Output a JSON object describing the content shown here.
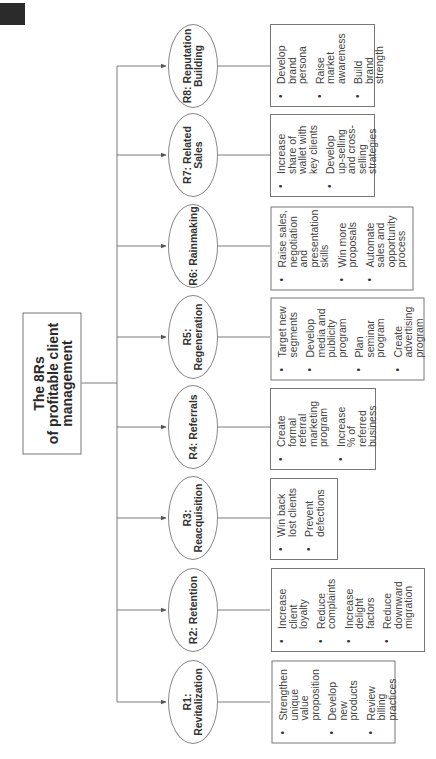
{
  "title": {
    "line1": "The 8Rs",
    "line2": "of profitable client",
    "line3": "management"
  },
  "colors": {
    "line": "#7a7a7a",
    "text": "#2a2a2a",
    "corner_mark": "#2b2b2b"
  },
  "branches": [
    {
      "id": "R1",
      "label": "R1: Revitalization",
      "items": [
        "Strengthen unique value proposition",
        "Develop new products",
        "Review billing practices"
      ]
    },
    {
      "id": "R2",
      "label": "R2: Retention",
      "items": [
        "Increase client loyalty",
        "Reduce complaints",
        "Increase delight factors",
        "Reduce downward migration"
      ]
    },
    {
      "id": "R3",
      "label": "R3: Reacquisition",
      "items": [
        "Win back lost clients",
        "Prevent defections"
      ]
    },
    {
      "id": "R4",
      "label": "R4: Referrals",
      "items": [
        "Create formal referral marketing program",
        "Increase % of referred business"
      ]
    },
    {
      "id": "R5",
      "label": "R5: Regeneration",
      "items": [
        "Target new segments",
        "Develop media and publicity program",
        "Plan seminar program",
        "Create advertising program"
      ]
    },
    {
      "id": "R6",
      "label": "R6: Rainmaking",
      "items": [
        "Raise sales, negotiation and presentation skills",
        "Win more proposals",
        "Automate sales and opportunity process"
      ]
    },
    {
      "id": "R7",
      "label": "R7: Related Sales",
      "items": [
        "Increase share of wallet with key clients",
        "Develop up-selling and cross-selling strategies"
      ]
    },
    {
      "id": "R8",
      "label": "R8: Reputation Building",
      "label_line1": "R8: Reputation",
      "label_line2": "Building",
      "items": [
        "Develop brand persona",
        "Raise market awareness",
        "Build brand strength"
      ]
    }
  ]
}
